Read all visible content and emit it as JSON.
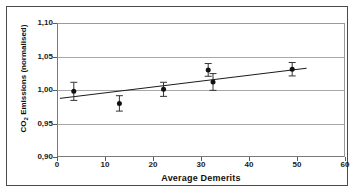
{
  "figure": {
    "frame": {
      "border_color": "#4a4a4a"
    },
    "background": "#ffffff"
  },
  "chart_data": {
    "type": "scatter",
    "title": "",
    "subtitle": "",
    "xlabel": "Average Demerits",
    "ylabel": "CO2 Emissions (normalised)",
    "ylabel_parts": {
      "prefix": "CO",
      "sub": "2",
      "suffix": " Emissions (normalised)"
    },
    "xlim": [
      0,
      60
    ],
    "ylim": [
      0.9,
      1.1
    ],
    "xticks": [
      0,
      10,
      20,
      30,
      40,
      50,
      60
    ],
    "xtick_labels": [
      "0",
      "10",
      "20",
      "30",
      "40",
      "50",
      "60"
    ],
    "yticks": [
      0.9,
      0.95,
      1.0,
      1.05,
      1.1
    ],
    "ytick_labels": [
      "0,90",
      "0,95",
      "1,00",
      "1,05",
      "1,10"
    ],
    "grid": {
      "horizontal": true,
      "vertical": false,
      "color": "#a8a8a8"
    },
    "legend": {
      "visible": false,
      "position": "none"
    },
    "marker": {
      "shape": "circle",
      "color": "#111111",
      "size": 5
    },
    "errorbar": {
      "color": "#333333",
      "cap_width": 7
    },
    "points": [
      {
        "x": 3.5,
        "y": 0.998,
        "yerr": 0.0135
      },
      {
        "x": 13.0,
        "y": 0.98,
        "yerr": 0.0115
      },
      {
        "x": 22.2,
        "y": 1.001,
        "yerr": 0.0105
      },
      {
        "x": 31.5,
        "y": 1.03,
        "yerr": 0.0095
      },
      {
        "x": 32.5,
        "y": 1.012,
        "yerr": 0.0125
      },
      {
        "x": 49.0,
        "y": 1.031,
        "yerr": 0.01
      }
    ],
    "trendline": {
      "type": "linear",
      "color": "#1b1b1b",
      "x_start": 0.6,
      "y_start": 0.9875,
      "x_end": 52.0,
      "y_end": 1.0325
    }
  }
}
